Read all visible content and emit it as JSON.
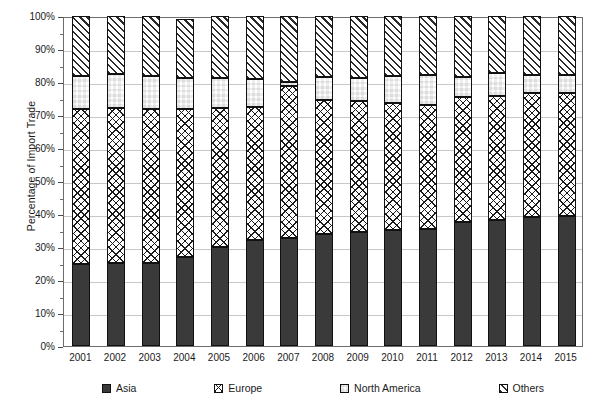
{
  "chart_data": {
    "type": "bar",
    "subtype": "stacked-percentage-column",
    "title": "",
    "xlabel": "",
    "ylabel": "Percentage of Import Trade",
    "ylim": [
      0,
      100
    ],
    "y_unit": "%",
    "grid": true,
    "legend_position": "bottom",
    "categories": [
      "2001",
      "2002",
      "2003",
      "2004",
      "2005",
      "2006",
      "2007",
      "2008",
      "2009",
      "2010",
      "2011",
      "2012",
      "2013",
      "2014",
      "2015"
    ],
    "y_tick_labels": [
      "0%",
      "10%",
      "20%",
      "30%",
      "40%",
      "50%",
      "60%",
      "70%",
      "80%",
      "90%",
      "100%"
    ],
    "y_tick_values": [
      0,
      10,
      20,
      30,
      40,
      50,
      60,
      70,
      80,
      90,
      100
    ],
    "series": [
      {
        "name": "Asia",
        "pattern": "solid-dark",
        "color": "#3a3a3a",
        "values": [
          24.8,
          25.2,
          25.2,
          27.0,
          30.0,
          32.1,
          32.7,
          33.9,
          34.5,
          35.2,
          35.5,
          37.6,
          38.2,
          39.1,
          39.4
        ]
      },
      {
        "name": "Europe",
        "pattern": "diagonal-crosshatch",
        "color": "#ffffff",
        "values": [
          47.1,
          46.8,
          46.6,
          44.8,
          42.2,
          40.3,
          46.0,
          40.7,
          39.7,
          38.4,
          37.5,
          37.9,
          37.6,
          37.6,
          37.3
        ]
      },
      {
        "name": "North America",
        "pattern": "checkerboard",
        "color": "#ffffff",
        "values": [
          9.9,
          10.4,
          10.1,
          9.5,
          9.0,
          8.5,
          1.3,
          7.0,
          7.0,
          8.2,
          9.0,
          6.0,
          7.0,
          5.3,
          5.3
        ]
      },
      {
        "name": "Others",
        "pattern": "diagonal-hatch",
        "color": "#ffffff",
        "values": [
          18.2,
          17.6,
          18.1,
          17.7,
          18.8,
          19.1,
          20.0,
          18.4,
          18.8,
          18.2,
          18.0,
          18.5,
          17.2,
          18.0,
          18.0
        ]
      }
    ],
    "segment_tops_percent": {
      "asia": [
        24.8,
        25.2,
        25.2,
        27.0,
        30.0,
        32.1,
        32.7,
        33.9,
        34.5,
        35.2,
        35.5,
        37.6,
        38.2,
        39.1,
        39.4
      ],
      "europe": [
        71.9,
        72.0,
        71.8,
        71.8,
        72.2,
        72.4,
        78.7,
        74.6,
        74.2,
        73.6,
        73.0,
        75.5,
        75.8,
        76.7,
        76.7
      ],
      "north_america": [
        81.8,
        82.4,
        81.9,
        81.3,
        81.2,
        80.9,
        80.0,
        81.6,
        81.2,
        81.8,
        82.0,
        81.5,
        82.8,
        82.0,
        82.0
      ],
      "others": [
        100,
        100,
        100,
        100,
        100,
        100,
        100,
        100,
        100,
        100,
        100,
        100,
        100,
        100,
        100
      ]
    }
  },
  "axes": {
    "y_title": "Percentage of Import Trade"
  },
  "legend": {
    "items": [
      {
        "label": "Asia",
        "swatch": "solid-dark-swatch-icon"
      },
      {
        "label": "Europe",
        "swatch": "crosshatch-swatch-icon"
      },
      {
        "label": "North America",
        "swatch": "checkerboard-swatch-icon"
      },
      {
        "label": "Others",
        "swatch": "diagonal-hatch-swatch-icon"
      }
    ]
  }
}
